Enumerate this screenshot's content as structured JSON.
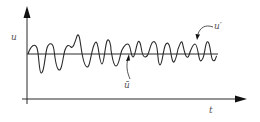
{
  "diagram": {
    "y_axis_label": "u",
    "x_axis_label": "t",
    "mean_label": "ū",
    "fluctuation_label": "u′",
    "colors": {
      "stroke": "#2a2a2a",
      "text": "#555555",
      "background": "#ffffff"
    }
  }
}
